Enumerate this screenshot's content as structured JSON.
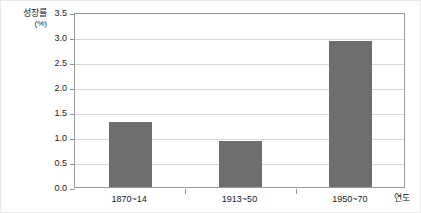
{
  "axis_title": {
    "name": "성장률",
    "unit": "(%)"
  },
  "x_axis_name": "연도",
  "colors": {
    "bar": "#6e6e6e",
    "plot_border": "#9a9a9a",
    "gridline": "#d7d7d7",
    "figure_border": "#e9e9e9",
    "text": "#1a1a1a"
  },
  "chart_data": {
    "type": "bar",
    "title": "",
    "subtitle": "",
    "xlabel": "연도",
    "ylabel": "성장률 (%)",
    "categories": [
      "1870~14",
      "1913~50",
      "1950~70"
    ],
    "values": [
      1.3,
      0.93,
      2.93
    ],
    "series": [
      {
        "name": "성장률",
        "values": [
          1.3,
          0.93,
          2.93
        ]
      }
    ],
    "ylim": [
      0.0,
      3.5
    ],
    "ytick_labels": [
      "0.0",
      "0.5",
      "1.0",
      "1.5",
      "2.0",
      "2.5",
      "3.0",
      "3.5"
    ],
    "ytick_values": [
      0.0,
      0.5,
      1.0,
      1.5,
      2.0,
      2.5,
      3.0,
      3.5
    ],
    "grid": true,
    "grid_axis": "y",
    "legend": false,
    "legend_position": "none",
    "bar_color": "#6e6e6e",
    "annotations": []
  }
}
